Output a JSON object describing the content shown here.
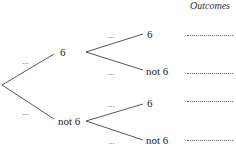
{
  "diagram": {
    "type": "probability-tree",
    "header": {
      "outcomes_title": "Outcomes"
    },
    "first_stage": {
      "branches": [
        {
          "label": "6",
          "probability_placeholder": "..."
        },
        {
          "label": "not 6",
          "probability_placeholder": "..."
        }
      ]
    },
    "second_stage": {
      "from_6": [
        {
          "label": "6",
          "probability_placeholder": "...",
          "outcome_placeholder": "..........."
        },
        {
          "label": "not 6",
          "probability_placeholder": "...",
          "outcome_placeholder": "..........."
        }
      ],
      "from_not_6": [
        {
          "label": "6",
          "probability_placeholder": "...",
          "outcome_placeholder": "..........."
        },
        {
          "label": "not 6",
          "probability_placeholder": "...",
          "outcome_placeholder": "..........."
        }
      ]
    },
    "colors": {
      "line": "#444444",
      "text": "#222222",
      "background": "#ffffff"
    }
  }
}
